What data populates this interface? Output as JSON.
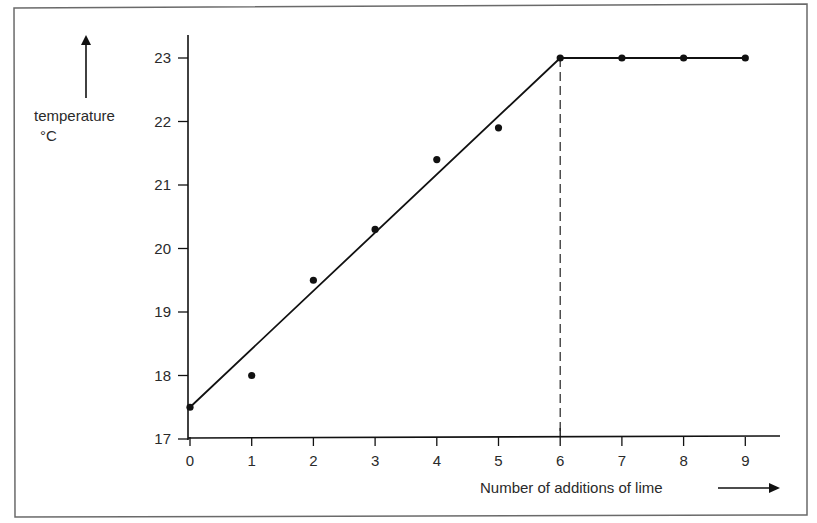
{
  "chart_data": {
    "type": "line",
    "title": "",
    "xlabel": "Number of additions of lime",
    "ylabel": "temperature",
    "ylabel_unit": "°C",
    "xlim": [
      0,
      9
    ],
    "ylim": [
      17,
      23
    ],
    "x_ticks": [
      0,
      1,
      2,
      3,
      4,
      5,
      6,
      7,
      8,
      9
    ],
    "y_ticks": [
      17,
      18,
      19,
      20,
      21,
      22,
      23
    ],
    "grid": false,
    "legend": null,
    "series": [
      {
        "name": "measured temperature",
        "kind": "scatter",
        "x": [
          0,
          1,
          2,
          3,
          4,
          5,
          6,
          7,
          8,
          9
        ],
        "values": [
          17.5,
          18.0,
          19.5,
          20.3,
          21.4,
          21.9,
          23.0,
          23.0,
          23.0,
          23.0
        ]
      },
      {
        "name": "best-fit line",
        "kind": "line",
        "x": [
          0,
          6,
          9
        ],
        "values": [
          17.5,
          23.0,
          23.0
        ]
      }
    ],
    "annotations": [
      {
        "type": "vertical-dashed-line",
        "x": 6,
        "from_y": 17,
        "to_y": 23,
        "meaning": "end point of neutralisation"
      }
    ]
  },
  "labels": {
    "y_axis": "temperature",
    "y_unit": "°C",
    "x_axis": "Number of additions of lime"
  }
}
